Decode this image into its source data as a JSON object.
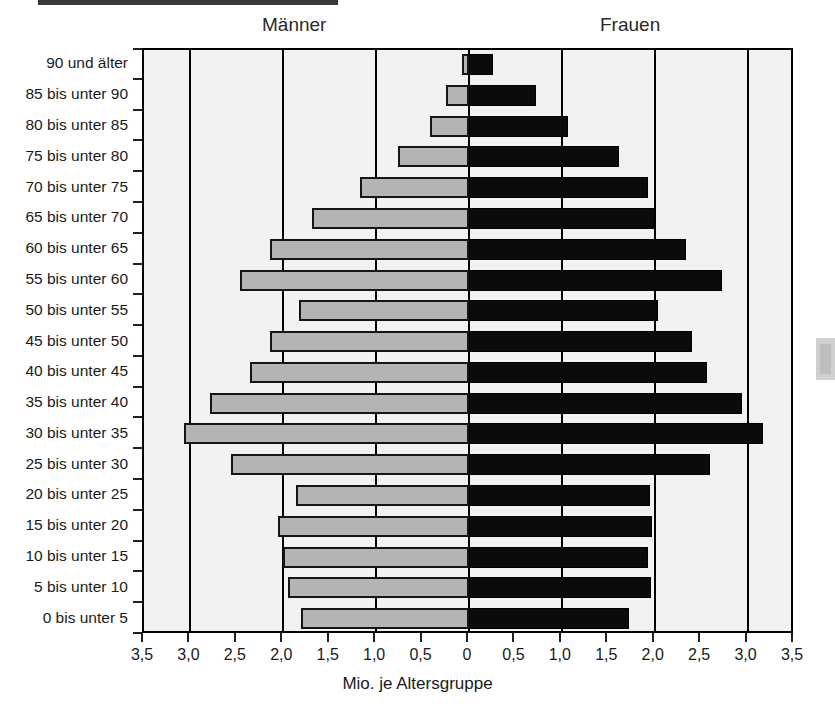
{
  "header": {
    "male_label": "Männer",
    "female_label": "Frauen"
  },
  "axis": {
    "x_title": "Mio. je Altersgruppe",
    "x_ticks": [
      "3,5",
      "3,0",
      "2,5",
      "2,0",
      "1,5",
      "1,0",
      "0,5",
      "0",
      "0,5",
      "1,0",
      "1,5",
      "2,0",
      "2,5",
      "3,0",
      "3,5"
    ]
  },
  "colors": {
    "male_bar": "#b4b4b4",
    "female_bar": "#0b0b0b",
    "plot_background": "#f2f2f2",
    "axis_line": "#000000"
  },
  "chart_data": {
    "type": "bar",
    "title": "",
    "subtitle": "",
    "orientation": "horizontal-diverging",
    "xlabel": "Mio. je Altersgruppe",
    "ylabel": "",
    "xlim": [
      -3.5,
      3.5
    ],
    "x_tick_values": [
      -3.5,
      -3.0,
      -2.5,
      -2.0,
      -1.5,
      -1.0,
      -0.5,
      0,
      0.5,
      1.0,
      1.5,
      2.0,
      2.5,
      3.0,
      3.5
    ],
    "x_tick_labels": [
      "3,5",
      "3,0",
      "2,5",
      "2,0",
      "1,5",
      "1,0",
      "0,5",
      "0",
      "0,5",
      "1,0",
      "1,5",
      "2,0",
      "2,5",
      "3,0",
      "3,5"
    ],
    "grid": "vertical gridlines at every 1,0 Mio.; ticks every 0,5 Mio.",
    "legend": "column headers: Männer (left), Frauen (right)",
    "categories": [
      "90 und älter",
      "85 bis unter 90",
      "80 bis unter 85",
      "75 bis unter 80",
      "70 bis unter 75",
      "65 bis unter 70",
      "60 bis unter 65",
      "55 bis unter 60",
      "50 bis unter 55",
      "45 bis unter 50",
      "40 bis unter 45",
      "35 bis unter 40",
      "30 bis unter 35",
      "25 bis unter 30",
      "20 bis unter 25",
      "15 bis unter 20",
      "10 bis unter 15",
      "5 bis unter 10",
      "0 bis unter  5"
    ],
    "series": [
      {
        "name": "Männer",
        "side": "left",
        "unit": "Mio.",
        "values": [
          0.08,
          0.25,
          0.42,
          0.77,
          1.17,
          1.69,
          2.14,
          2.47,
          1.83,
          2.14,
          2.36,
          2.79,
          3.07,
          2.56,
          1.86,
          2.06,
          2.0,
          1.95,
          1.81
        ]
      },
      {
        "name": "Frauen",
        "side": "right",
        "unit": "Mio.",
        "values": [
          0.26,
          0.72,
          1.07,
          1.62,
          1.93,
          2.0,
          2.34,
          2.72,
          2.03,
          2.4,
          2.56,
          2.94,
          3.17,
          2.6,
          1.95,
          1.97,
          1.93,
          1.96,
          1.72
        ]
      }
    ]
  }
}
